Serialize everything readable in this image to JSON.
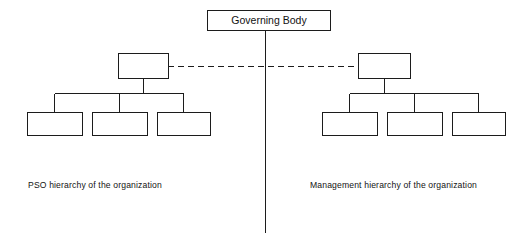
{
  "diagram": {
    "title_box": {
      "label": "Governing Body",
      "x": 207,
      "y": 10,
      "width": 123,
      "height": 20
    },
    "divider": {
      "name": "central-vertical-divider",
      "x": 265,
      "y_start": 30,
      "y_end": 232
    },
    "cross_link": {
      "name": "dashed-cross-hierarchy-link",
      "style": "dashed",
      "x_start": 168,
      "x_end": 358,
      "y": 66
    },
    "left_branch": {
      "caption": "PSO hierarchy of the organization",
      "parent_box": {
        "label": "",
        "x": 118,
        "y": 53,
        "width": 50,
        "height": 25
      },
      "child_boxes": [
        {
          "label": "",
          "x": 27,
          "y": 112,
          "width": 55,
          "height": 23
        },
        {
          "label": "",
          "x": 92,
          "y": 112,
          "width": 55,
          "height": 23
        },
        {
          "label": "",
          "x": 157,
          "y": 112,
          "width": 53,
          "height": 23
        }
      ],
      "connector_rail_y": 93
    },
    "right_branch": {
      "caption": "Management hierarchy of the organization",
      "parent_box": {
        "label": "",
        "x": 358,
        "y": 53,
        "width": 52,
        "height": 25
      },
      "child_boxes": [
        {
          "label": "",
          "x": 322,
          "y": 112,
          "width": 55,
          "height": 23
        },
        {
          "label": "",
          "x": 387,
          "y": 112,
          "width": 55,
          "height": 23
        },
        {
          "label": "",
          "x": 452,
          "y": 112,
          "width": 53,
          "height": 23
        }
      ],
      "connector_rail_y": 93
    },
    "colors": {
      "line": "#1c1c1c",
      "box_fill": "#ffffff",
      "text": "#121212",
      "background": "#ffffff"
    }
  }
}
